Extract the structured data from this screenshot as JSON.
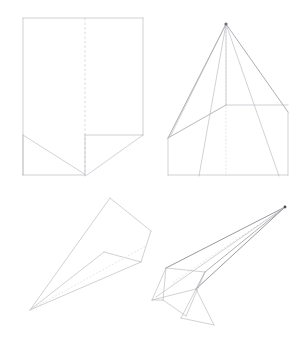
{
  "document": {
    "title": "Paper Airplane Folding Instructions",
    "subject": "paper-airplane-fold-diagram",
    "background_color": "#ffffff",
    "line_color": "#8d8d92",
    "crease_color": "#c3c3c9",
    "accent_color": "#6d6d74",
    "width": 300,
    "height": 348
  },
  "steps": [
    {
      "id": "step-1",
      "name": "flat-sheet-with-center-crease",
      "description": "Rectangular sheet of paper with vertical center crease and bottom corner folds",
      "position": "top-left"
    },
    {
      "id": "step-2",
      "name": "corners-folded-to-center",
      "description": "Top corners folded inward to meet at the center line forming a point",
      "position": "top-right"
    },
    {
      "id": "step-3",
      "name": "folded-dart-flat",
      "description": "Paper folded into a flat elongated dart shape with nose at left",
      "position": "bottom-left"
    },
    {
      "id": "step-4",
      "name": "finished-paper-airplane",
      "description": "Completed paper airplane shown in three quarter perspective view",
      "position": "bottom-right"
    }
  ],
  "geometry": {
    "step1": {
      "outline": "23,18 143,18 143,135 95,175 23,175",
      "center_crease": "85,18 85,175",
      "fold_lines": [
        "23,135 85,175",
        "143,135 95,175",
        "23,135 143,135"
      ]
    },
    "step2": {
      "apex": "226,24",
      "outline": "168,175 168,138 226,24 288,112 288,175",
      "center_crease": "226,24 226,185",
      "fold_lines": [
        "226,24 168,138",
        "226,24 288,112",
        "226,24 199,175",
        "226,24 278,175",
        "168,138 226,105",
        "226,105 288,105",
        "168,138 168,175",
        "288,112 288,175",
        "168,175 288,175"
      ]
    },
    "step3": {
      "outline": "30,310 110,198 150,230 142,262 105,253",
      "fold_lines": [
        "30,310 142,262",
        "30,310 105,253"
      ]
    },
    "step4": {
      "nose": "285,207",
      "wing_outline": "285,207 166,268 152,300 196,289",
      "fuselage": [
        "285,207 196,289",
        "285,207 205,272",
        "166,268 205,272",
        "205,272 196,289",
        "196,289 215,325",
        "205,272 180,318",
        "152,300 163,318",
        "163,318 185,330"
      ]
    }
  }
}
